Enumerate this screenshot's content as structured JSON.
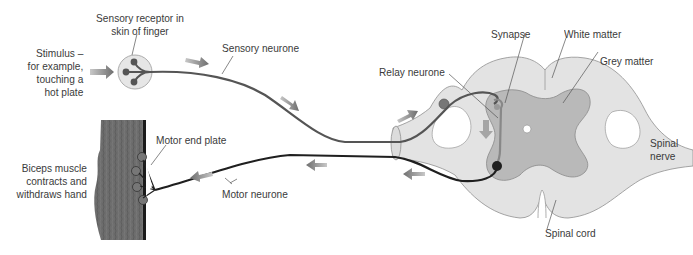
{
  "diagram": {
    "colors": {
      "background": "#ffffff",
      "white_matter": "#e3e3e3",
      "grey_matter": "#b9b9b9",
      "outline": "#8a8a8a",
      "neurone": "#4a4a4a",
      "motor_neurone": "#1f1f1f",
      "arrow": "#7a7a7a",
      "muscle": "#6b6b6b",
      "label_text": "#3a3a3a"
    },
    "labels": {
      "stimulus": [
        "Stimulus –",
        "for example,",
        "touching a",
        "hot plate"
      ],
      "sensory_receptor": [
        "Sensory receptor in",
        "skin of finger"
      ],
      "sensory_neurone": "Sensory neurone",
      "relay_neurone": "Relay neurone",
      "synapse": "Synapse",
      "white_matter": "White matter",
      "grey_matter": "Grey matter",
      "spinal_nerve": [
        "Spinal",
        "nerve"
      ],
      "spinal_cord": "Spinal cord",
      "motor_end_plate": "Motor end plate",
      "motor_neurone": "Motor neurone",
      "biceps": [
        "Biceps muscle",
        "contracts and",
        "withdraws hand"
      ]
    }
  }
}
